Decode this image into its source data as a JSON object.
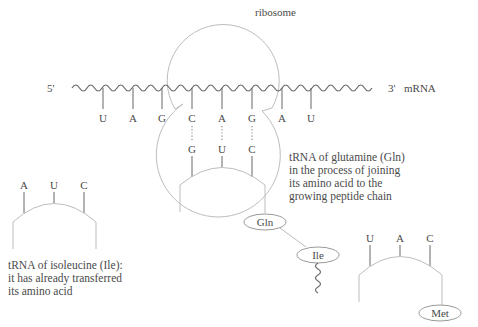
{
  "labels": {
    "ribosome": "ribosome",
    "five_prime": "5'",
    "three_prime": "3'",
    "mrna": "mRNA"
  },
  "mrna_codons": [
    "U",
    "A",
    "G",
    "C",
    "A",
    "G",
    "A",
    "U",
    "G"
  ],
  "tRNA_gln": {
    "anticodon": [
      "G",
      "U",
      "C"
    ],
    "amino_acid": "Gln",
    "caption": [
      "tRNA of glutamine (Gln)",
      "in the process of joining",
      "its amino acid to the",
      "growing peptide chain"
    ]
  },
  "tRNA_ile": {
    "anticodon": [
      "A",
      "U",
      "C"
    ],
    "caption": [
      "tRNA of isoleucine (Ile):",
      "it has already transferred",
      "its amino acid"
    ]
  },
  "peptide_chain": {
    "residues": [
      "Gln",
      "Ile"
    ]
  },
  "tRNA_met": {
    "anticodon": [
      "U",
      "A",
      "C"
    ],
    "amino_acid": "Met"
  },
  "colors": {
    "text": "#4a4a4a",
    "ribosome_outline": "#bdbdbd",
    "mrna_strand": "#6a6a6a"
  }
}
